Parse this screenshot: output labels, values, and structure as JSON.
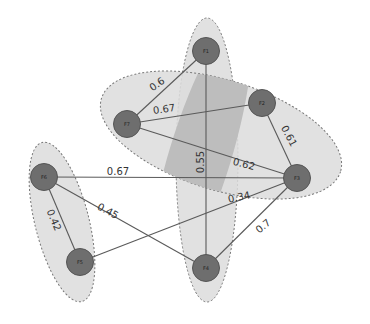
{
  "diagram": {
    "type": "weighted-graph-with-clusters",
    "colors": {
      "node_fill": "#6e6e6e",
      "node_stroke": "#555555",
      "edge": "#5a5a5a",
      "cluster_fill": "#dcdcdc",
      "cluster_stroke": "#777777",
      "overlap_fill": "#bdbdbd"
    },
    "clusters": [
      {
        "id": "cluster-vertical",
        "cx": 207,
        "cy": 160,
        "rx": 31,
        "ry": 142,
        "rotate": 0
      },
      {
        "id": "cluster-diagonal",
        "cx": 221,
        "cy": 135,
        "rx": 125,
        "ry": 55,
        "rotate": 17
      },
      {
        "id": "cluster-left",
        "cx": 62,
        "cy": 222,
        "rx": 27,
        "ry": 82,
        "rotate": -14
      }
    ],
    "nodes": [
      {
        "id": "F1",
        "label": "F1",
        "x": 206,
        "y": 51
      },
      {
        "id": "F2",
        "label": "F2",
        "x": 262,
        "y": 103
      },
      {
        "id": "F7",
        "label": "F7",
        "x": 127,
        "y": 124
      },
      {
        "id": "F6",
        "label": "F6",
        "x": 44,
        "y": 177
      },
      {
        "id": "F3",
        "label": "F3",
        "x": 297,
        "y": 178
      },
      {
        "id": "F5",
        "label": "F5",
        "x": 80,
        "y": 262
      },
      {
        "id": "F4",
        "label": "F4",
        "x": 206,
        "y": 268
      }
    ],
    "edges": [
      {
        "from": "F1",
        "to": "F7",
        "weight": "0.6",
        "lx": 157,
        "ly": 84,
        "rot": -35
      },
      {
        "from": "F7",
        "to": "F2",
        "weight": "0.67",
        "lx": 164,
        "ly": 109,
        "rot": -8
      },
      {
        "from": "F2",
        "to": "F3",
        "weight": "0.61",
        "lx": 289,
        "ly": 136,
        "rot": 62
      },
      {
        "from": "F7",
        "to": "F3",
        "weight": "0.62",
        "lx": 244,
        "ly": 164,
        "rot": 15
      },
      {
        "from": "F1",
        "to": "F4",
        "weight": "0.55",
        "lx": 200,
        "ly": 162,
        "rot": -90
      },
      {
        "from": "F6",
        "to": "F3",
        "weight": "0.67",
        "lx": 118,
        "ly": 171,
        "rot": 0
      },
      {
        "from": "F5",
        "to": "F3",
        "weight": "0.34",
        "lx": 239,
        "ly": 197,
        "rot": -12
      },
      {
        "from": "F6",
        "to": "F4",
        "weight": "0.45",
        "lx": 108,
        "ly": 211,
        "rot": 28
      },
      {
        "from": "F6",
        "to": "F5",
        "weight": "0.42",
        "lx": 54,
        "ly": 220,
        "rot": 67
      },
      {
        "from": "F3",
        "to": "F4",
        "weight": "0.7",
        "lx": 263,
        "ly": 226,
        "rot": -40
      }
    ]
  }
}
